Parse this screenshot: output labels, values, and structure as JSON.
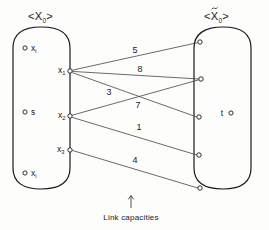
{
  "figure": {
    "left_set": {
      "title_prefix": "<",
      "title_base": "X",
      "title_sub": "0",
      "title_suffix": ">",
      "title_full": "<X0>"
    },
    "right_set": {
      "title_prefix": "<",
      "title_base": "X",
      "title_tilde": "~",
      "title_sub": "0",
      "title_suffix": ">",
      "title_full": "<X~0>"
    },
    "left_interior_nodes": [
      {
        "label_base": "x",
        "label_sub": "i",
        "marker": "circle"
      },
      {
        "label_base": "s",
        "label_sub": "",
        "marker": "circle"
      },
      {
        "label_base": "x",
        "label_sub": "i",
        "marker": "circle"
      }
    ],
    "left_boundary_nodes": [
      {
        "label_base": "x",
        "label_sub": "1",
        "marker": "circle"
      },
      {
        "label_base": "x",
        "label_sub": "2",
        "marker": "circle"
      },
      {
        "label_base": "x",
        "label_sub": "3",
        "marker": "circle"
      }
    ],
    "right_interior_nodes": [
      {
        "label_base": "t",
        "label_sub": "",
        "marker": "circle"
      }
    ],
    "right_boundary_nodes": [
      {
        "index": "1",
        "marker": "circle"
      },
      {
        "index": "2",
        "marker": "circle"
      },
      {
        "index": "3",
        "marker": "circle"
      },
      {
        "index": "4",
        "marker": "circle"
      },
      {
        "index": "5",
        "marker": "circle"
      }
    ],
    "links": [
      {
        "from": "x1",
        "to": "r1",
        "capacity": "5"
      },
      {
        "from": "x1",
        "to": "r2",
        "capacity": "8"
      },
      {
        "from": "x1",
        "to": "r3",
        "capacity": "3"
      },
      {
        "from": "x2",
        "to": "r2",
        "capacity": "7"
      },
      {
        "from": "x2",
        "to": "r4",
        "capacity": "1"
      },
      {
        "from": "x3",
        "to": "r5",
        "capacity": "4"
      }
    ],
    "caption": {
      "text": "Link capacities",
      "arrow": "up-arrow"
    },
    "colors": {
      "stroke": "#1a1a1a",
      "link_stroke": "#3a3a3a",
      "background": "#fdfdfc"
    }
  }
}
